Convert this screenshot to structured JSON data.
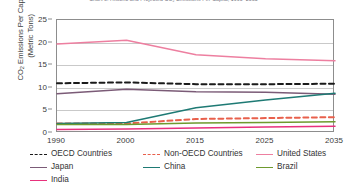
{
  "chart_data": {
    "type": "line",
    "title": "Chart 3. Historic and Projected CO₂ Emissions Per Capita, 1990–2035",
    "xlabel": "",
    "ylabel": "CO2 Emissions Per Capita (Metric Tons)",
    "ylabel_line1": "CO",
    "ylabel_sub": "2",
    "ylabel_line1_rest": " Emissions Per Capita",
    "ylabel_line2": "(Metric Tons)",
    "x": [
      "1990",
      "2000",
      "2015",
      "2025",
      "2035"
    ],
    "xticklabels": [
      "1990",
      "2000",
      "2015",
      "2025",
      "2035"
    ],
    "yticklabels": [
      "0",
      "5",
      "10",
      "15",
      "20",
      "25"
    ],
    "yticks": [
      0,
      5,
      10,
      15,
      20,
      25
    ],
    "ylim": [
      0,
      25
    ],
    "grid": true,
    "legend_position": "bottom",
    "series": [
      {
        "name": "OECD Countries",
        "style": "dashed",
        "color": "#1a1a1a",
        "values": [
          11.0,
          11.2,
          10.8,
          10.8,
          10.9
        ]
      },
      {
        "name": "Non-OECD Countries",
        "style": "dashed",
        "color": "#E8604C",
        "values": [
          2.1,
          2.1,
          3.1,
          3.3,
          3.5
        ]
      },
      {
        "name": "United States",
        "style": "solid",
        "color": "#ED7FA0",
        "values": [
          19.7,
          20.5,
          17.3,
          16.4,
          16.0
        ]
      },
      {
        "name": "Japan",
        "style": "solid",
        "color": "#7B5B77",
        "values": [
          8.7,
          9.7,
          9.1,
          9.0,
          8.6
        ]
      },
      {
        "name": "China",
        "style": "solid",
        "color": "#1E7A74",
        "values": [
          2.1,
          2.3,
          5.6,
          7.3,
          8.8
        ]
      },
      {
        "name": "Brazil",
        "style": "solid",
        "color": "#6E9A2E",
        "values": [
          1.9,
          1.9,
          2.2,
          2.3,
          2.5
        ]
      },
      {
        "name": "India",
        "style": "solid",
        "color": "#E8317C",
        "values": [
          0.8,
          0.9,
          1.1,
          1.3,
          1.5
        ]
      }
    ]
  },
  "legend": {
    "items": [
      {
        "label": "OECD Countries",
        "color": "#1a1a1a",
        "style": "dash"
      },
      {
        "label": "Non-OECD Countries",
        "color": "#E8604C",
        "style": "dash"
      },
      {
        "label": "United States",
        "color": "#ED7FA0",
        "style": "solid"
      },
      {
        "label": "Japan",
        "color": "#7B5B77",
        "style": "solid"
      },
      {
        "label": "China",
        "color": "#1E7A74",
        "style": "solid"
      },
      {
        "label": "Brazil",
        "color": "#6E9A2E",
        "style": "solid"
      },
      {
        "label": "India",
        "color": "#E8317C",
        "style": "solid"
      }
    ]
  }
}
